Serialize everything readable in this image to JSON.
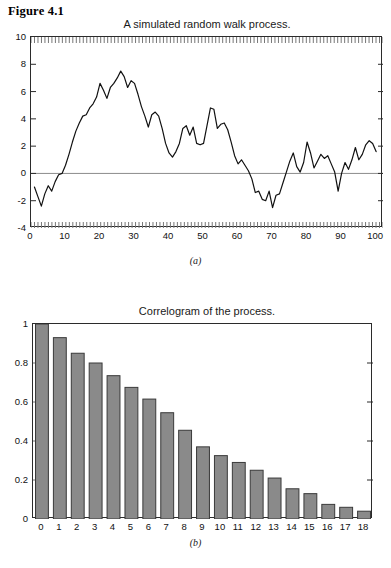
{
  "figure": {
    "label": "Figure 4.1"
  },
  "panel_a": {
    "title": "A simulated random walk process.",
    "caption": "(a)"
  },
  "panel_b": {
    "title": "Correlogram of the process.",
    "caption": "(b)"
  },
  "colors": {
    "axis": "#2b2b2b",
    "line": "#111111",
    "zero_line": "#8c8c8c",
    "bar_fill": "#8a8a8a",
    "bar_stroke": "#3a3a3a",
    "tick": "#777777",
    "background": "#ffffff"
  },
  "chart_data": [
    {
      "type": "line",
      "title": "A simulated random walk process.",
      "xlabel": "",
      "ylabel": "",
      "xlim": [
        0,
        102
      ],
      "ylim": [
        -4,
        10
      ],
      "xticks": [
        0,
        10,
        20,
        30,
        40,
        50,
        60,
        70,
        80,
        90,
        100
      ],
      "yticks": [
        -4,
        -2,
        0,
        2,
        4,
        6,
        8,
        10
      ],
      "grid": false,
      "zero_line": 0,
      "minor_ticks": "dense ticks on top and bottom frame edges",
      "legend": null,
      "series": [
        {
          "name": "random walk",
          "x": [
            1,
            2,
            3,
            4,
            5,
            6,
            7,
            8,
            9,
            10,
            11,
            12,
            13,
            14,
            15,
            16,
            17,
            18,
            19,
            20,
            21,
            22,
            23,
            24,
            25,
            26,
            27,
            28,
            29,
            30,
            31,
            32,
            33,
            34,
            35,
            36,
            37,
            38,
            39,
            40,
            41,
            42,
            43,
            44,
            45,
            46,
            47,
            48,
            49,
            50,
            51,
            52,
            53,
            54,
            55,
            56,
            57,
            58,
            59,
            60,
            61,
            62,
            63,
            64,
            65,
            66,
            67,
            68,
            69,
            70,
            71,
            72,
            73,
            74,
            75,
            76,
            77,
            78,
            79,
            80,
            81,
            82,
            83,
            84,
            85,
            86,
            87,
            88,
            89,
            90,
            91,
            92,
            93,
            94,
            95,
            96,
            97,
            98,
            99,
            100
          ],
          "values": [
            -1.0,
            -1.7,
            -2.4,
            -1.5,
            -0.9,
            -1.3,
            -0.6,
            -0.1,
            0.0,
            0.6,
            1.4,
            2.3,
            3.1,
            3.7,
            4.2,
            4.3,
            4.8,
            5.1,
            5.6,
            6.6,
            6.1,
            5.5,
            6.3,
            6.6,
            7.0,
            7.5,
            7.1,
            6.3,
            6.8,
            6.6,
            5.8,
            4.9,
            4.2,
            3.4,
            4.3,
            4.5,
            4.2,
            3.3,
            2.2,
            1.5,
            1.2,
            1.6,
            2.2,
            3.3,
            3.5,
            2.8,
            3.4,
            2.2,
            2.1,
            2.2,
            3.5,
            4.8,
            4.7,
            3.3,
            3.6,
            3.7,
            3.2,
            2.3,
            1.3,
            0.7,
            1.0,
            0.6,
            0.2,
            -0.4,
            -1.4,
            -1.3,
            -1.9,
            -2.0,
            -1.3,
            -2.5,
            -1.6,
            -1.5,
            -0.7,
            0.1,
            0.9,
            1.5,
            0.5,
            0.1,
            0.8,
            2.3,
            1.5,
            0.4,
            0.9,
            1.4,
            1.1,
            1.3,
            0.7,
            0.1,
            -1.3,
            0.0,
            0.8,
            0.3,
            1.0,
            1.9,
            1.0,
            1.4,
            2.1,
            2.4,
            2.2,
            1.6,
            1.7,
            1.9
          ]
        }
      ]
    },
    {
      "type": "bar",
      "title": "Correlogram of the process.",
      "xlabel": "",
      "ylabel": "",
      "ylim": [
        0,
        1
      ],
      "yticks": [
        0,
        0.2,
        0.4,
        0.6,
        0.8,
        1
      ],
      "categories": [
        "0",
        "1",
        "2",
        "3",
        "4",
        "5",
        "6",
        "7",
        "8",
        "9",
        "10",
        "11",
        "12",
        "13",
        "14",
        "15",
        "16",
        "17",
        "18"
      ],
      "values": [
        1.0,
        0.93,
        0.85,
        0.8,
        0.735,
        0.675,
        0.615,
        0.545,
        0.455,
        0.37,
        0.325,
        0.29,
        0.25,
        0.21,
        0.155,
        0.13,
        0.075,
        0.06,
        0.04
      ],
      "grid": false,
      "legend": null
    }
  ]
}
